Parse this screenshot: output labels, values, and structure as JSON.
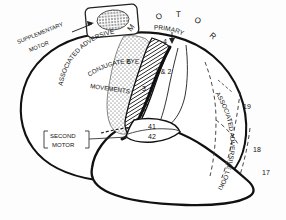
{
  "figure": {
    "name": "lateral-brain-cortical-areas-diagram",
    "type": "anatomical-line-drawing",
    "background_color": "#fdfdfd",
    "ink_color": "#111111"
  },
  "labels": {
    "supplementary_motor": "SUPPLEMENTARY\nMOTOR",
    "supplementary_motor_line1": "SUPPLEMENTARY",
    "supplementary_motor_line2": "MOTOR",
    "second_motor_line1": "SECOND",
    "second_motor_line2": "MOTOR",
    "associated_adversive_left": "ASSOCIATED ADVERSIVE",
    "conjugate_eye_line1": "CONJUGATE EYE",
    "conjugate_eye_line2": "MOVEMENTS",
    "associated_adversive_right": "ASSOCIATED ADVERSIVE LOOKING",
    "motor_heading": "M O T O R",
    "primary": "PRIMARY"
  },
  "motor_heading_letters": [
    "M",
    "O",
    "T",
    "O",
    "R"
  ],
  "area_numbers": [
    {
      "id": "area-6",
      "text": "6"
    },
    {
      "id": "area-4",
      "text": "4"
    },
    {
      "id": "area-1-2",
      "text": "1 & 2"
    },
    {
      "id": "area-3",
      "text": "3"
    },
    {
      "id": "area-41",
      "text": "41"
    },
    {
      "id": "area-42",
      "text": "42"
    },
    {
      "id": "area-19",
      "text": "19"
    },
    {
      "id": "area-18",
      "text": "18"
    },
    {
      "id": "area-17",
      "text": "17"
    }
  ],
  "regions": {
    "inset_box": "supplementary-motor-inset",
    "hatched_band": "precentral-area-4-band",
    "stippled_field": "premotor-area-6-field"
  }
}
